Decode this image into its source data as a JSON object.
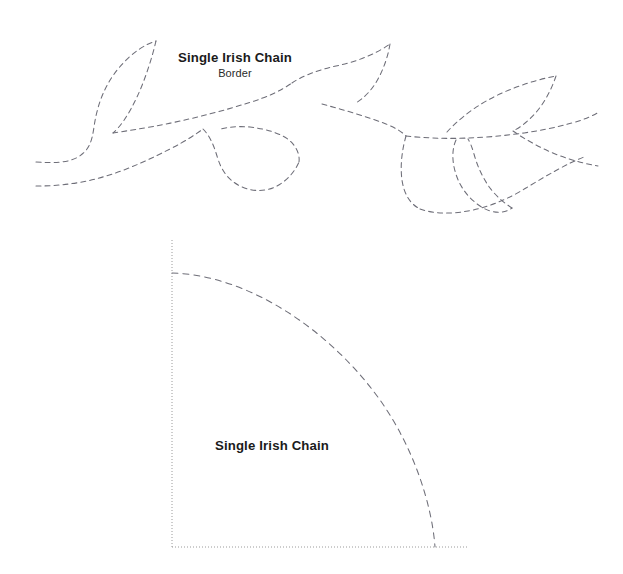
{
  "document": {
    "background_color": "#ffffff",
    "width": 623,
    "height": 574
  },
  "border_section": {
    "name": "border-pattern",
    "title": "Single Irish Chain",
    "subtitle": "Border",
    "stroke_color": "#6e6e78",
    "stroke_style": "dashed",
    "stroke_width": 1,
    "dash_pattern": "5 4"
  },
  "block_section": {
    "name": "block-pattern",
    "title": "Single Irish Chain",
    "arc_stroke_color": "#6e6e78",
    "frame_stroke_color": "#9a9a9a",
    "frame_style": "dotted",
    "arc_style": "dashed",
    "frame": {
      "left_x": 172,
      "top_y": 240,
      "bottom_y": 547,
      "right_x": 468
    },
    "arc": {
      "start_x": 172,
      "start_y": 273,
      "end_x": 435,
      "end_y": 547
    }
  }
}
